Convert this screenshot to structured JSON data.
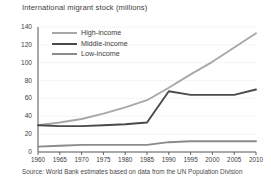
{
  "chart_data": {
    "type": "line",
    "title": "International migrant stock (millions)",
    "xlabel": "",
    "ylabel": "",
    "source": "Source: World Bank estimates based on data from the UN Population Division",
    "x": [
      1960,
      1965,
      1970,
      1975,
      1980,
      1985,
      1990,
      1995,
      2000,
      2005,
      2010
    ],
    "xtick_labels": [
      "1960",
      "1965",
      "1970",
      "1975",
      "1980",
      "1985",
      "1990",
      "1995",
      "2000",
      "2005",
      "2010"
    ],
    "ytick_labels": [
      "0",
      "20",
      "40",
      "60",
      "80",
      "100",
      "120",
      "140"
    ],
    "yticks": [
      0,
      20,
      40,
      60,
      80,
      100,
      120,
      140
    ],
    "ylim": [
      0,
      140
    ],
    "xlim": [
      1960,
      2010
    ],
    "grid": true,
    "legend_position": "top-left",
    "series": [
      {
        "name": "High-income",
        "color": "#a8a8a8",
        "values": [
          30,
          33,
          37,
          43,
          50,
          58,
          72,
          87,
          101,
          117,
          133
        ]
      },
      {
        "name": "Middle-income",
        "color": "#4a4a4a",
        "values": [
          30,
          29,
          29,
          30,
          31,
          33,
          68,
          64,
          64,
          64,
          70
        ]
      },
      {
        "name": "Low-income",
        "color": "#8a8a8a",
        "values": [
          6,
          7,
          8,
          8,
          8,
          8,
          11,
          12,
          12,
          12,
          12
        ]
      }
    ]
  },
  "axis": {
    "axis_color": "#555555",
    "grid_color": "#d9d9d9"
  }
}
